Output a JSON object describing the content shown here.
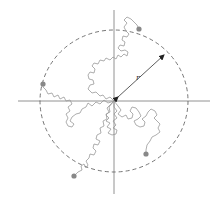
{
  "diagram": {
    "type": "random-walk-radius",
    "radius_label": "r",
    "colors": {
      "axes": "#777777",
      "circle": "#666666",
      "walks": "#999999",
      "endpoints": "#888888",
      "arrow": "#333333"
    },
    "origin": [
      114,
      101
    ],
    "circle_radius": 74,
    "endpoints": [
      {
        "name": "walk-end-top-right",
        "x": 139,
        "y": 29
      },
      {
        "name": "walk-end-left",
        "x": 43,
        "y": 84
      },
      {
        "name": "walk-end-bottom-right",
        "x": 146,
        "y": 154
      },
      {
        "name": "walk-end-bottom-left",
        "x": 74,
        "y": 176
      }
    ]
  }
}
